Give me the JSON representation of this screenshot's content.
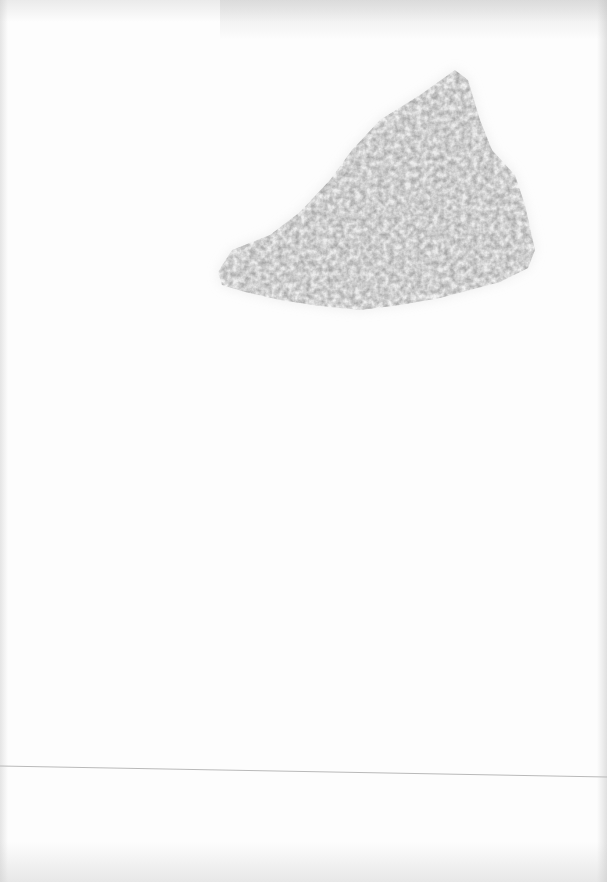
{
  "page": {
    "width": 607,
    "height": 882,
    "background": "#fdfdfd"
  },
  "smudge": {
    "description": "gray pencil-texture smudge",
    "color": "#c8c8c8",
    "points": "218,272 232,250 270,235 300,212 330,180 352,150 380,120 420,95 455,70 468,80 480,120 492,150 515,175 525,205 535,250 528,268 500,282 470,290 440,298 400,305 360,310 320,306 280,300 245,292 222,285"
  },
  "rule": {
    "x1": 0,
    "y1": 766,
    "x2": 607,
    "y2": 777,
    "color": "#b9b9b9"
  }
}
